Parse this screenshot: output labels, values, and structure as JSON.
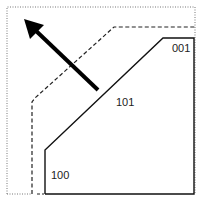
{
  "diagram": {
    "labels": {
      "top_right": "001",
      "middle": "101",
      "bottom_left": "100"
    },
    "colors": {
      "line": "#111111",
      "dotted_border": "#666666",
      "background": "#ffffff"
    },
    "arrow": {
      "direction": "up-left"
    }
  }
}
